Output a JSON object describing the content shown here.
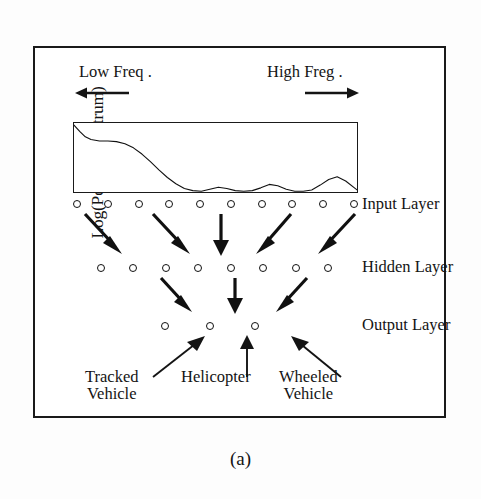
{
  "figure": {
    "caption": "(a)",
    "y_axis_label": "Log(Power Spectrum)",
    "low_freq_label": "Low Freq .",
    "high_freq_label": "High Freg ."
  },
  "layers": {
    "input": {
      "label": "Input Layer",
      "node_count": 10
    },
    "hidden": {
      "label": "Hidden Layer",
      "node_count": 8
    },
    "output": {
      "label": "Output Layer",
      "node_count": 3
    }
  },
  "categories": [
    {
      "line1": "Tracked",
      "line2": "Vehicle"
    },
    {
      "line1": "Helicopter",
      "line2": ""
    },
    {
      "line1": "Wheeled",
      "line2": "Vehicle"
    }
  ],
  "colors": {
    "ink": "#141414",
    "frame": "#1a1a1a",
    "paper": "#ffffff"
  },
  "chart_data": {
    "type": "line",
    "title": "",
    "xlabel": "Frequency",
    "ylabel": "Log(Power Spectrum)",
    "grid": false,
    "legend": "none",
    "xlim": [
      0,
      100
    ],
    "ylim": [
      0,
      100
    ],
    "annotations": [
      "Low Freq .",
      "High Freg ."
    ],
    "series": [
      {
        "name": "Log power spectrum",
        "x": [
          0,
          2,
          4,
          6,
          9,
          12,
          15,
          18,
          21,
          24,
          27,
          30,
          33,
          36,
          39,
          42,
          45,
          48,
          51,
          54,
          57,
          60,
          63,
          66,
          69,
          72,
          75,
          78,
          81,
          84,
          87,
          90,
          93,
          96,
          100
        ],
        "y": [
          97,
          88,
          80,
          76,
          74,
          74,
          73,
          70,
          64,
          55,
          44,
          32,
          21,
          12,
          5,
          2,
          1,
          4,
          7,
          5,
          2,
          1,
          2,
          6,
          11,
          9,
          4,
          1,
          1,
          3,
          10,
          18,
          22,
          16,
          3
        ]
      }
    ]
  },
  "arrows": {
    "input_to_hidden": [
      {
        "angle_deg": 55
      },
      {
        "angle_deg": 60
      },
      {
        "angle_deg": 90
      },
      {
        "angle_deg": 120
      },
      {
        "angle_deg": 125
      }
    ],
    "hidden_to_output": [
      {
        "angle_deg": 58
      },
      {
        "angle_deg": 90
      },
      {
        "angle_deg": 122
      }
    ],
    "caption_to_output": [
      {
        "angle_deg": 45
      },
      {
        "angle_deg": 90
      },
      {
        "angle_deg": 135
      }
    ]
  }
}
